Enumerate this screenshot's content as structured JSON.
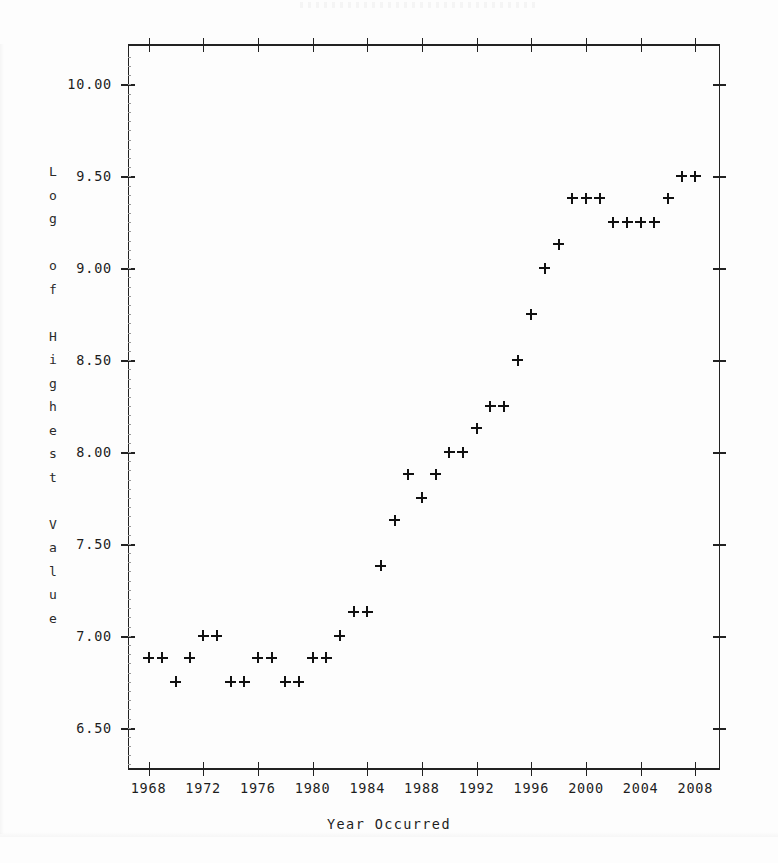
{
  "chart_data": {
    "type": "scatter",
    "title": "",
    "xlabel": "Year Occurred",
    "ylabel": "Log of Highest Value",
    "xlim": [
      1966.5,
      2009.8
    ],
    "ylim": [
      6.27,
      10.22
    ],
    "grid": false,
    "legend": null,
    "marker": "plus",
    "xticks": [
      1968,
      1972,
      1976,
      1980,
      1984,
      1988,
      1992,
      1996,
      2000,
      2004,
      2008
    ],
    "xtick_labels": [
      "1968",
      "1972",
      "1976",
      "1980",
      "1984",
      "1988",
      "1992",
      "1996",
      "2000",
      "2004",
      "2008"
    ],
    "yticks": [
      6.5,
      7.0,
      7.5,
      8.0,
      8.5,
      9.0,
      9.5,
      10.0
    ],
    "ytick_labels": [
      "6.50",
      "7.00",
      "7.50",
      "8.00",
      "8.50",
      "9.00",
      "9.50",
      "10.00"
    ],
    "x": [
      1968,
      1969,
      1970,
      1971,
      1972,
      1973,
      1974,
      1975,
      1976,
      1977,
      1978,
      1979,
      1980,
      1981,
      1982,
      1983,
      1984,
      1985,
      1986,
      1987,
      1988,
      1989,
      1990,
      1991,
      1992,
      1993,
      1994,
      1995,
      1996,
      1997,
      1998,
      1999,
      2000,
      2001,
      2002,
      2003,
      2004,
      2005,
      2006,
      2007,
      2008
    ],
    "y": [
      6.88,
      6.88,
      6.75,
      6.88,
      7.0,
      7.0,
      6.75,
      6.75,
      6.88,
      6.88,
      6.75,
      6.75,
      6.88,
      6.88,
      7.0,
      7.13,
      7.13,
      7.38,
      7.63,
      7.88,
      7.75,
      7.88,
      8.0,
      8.0,
      8.13,
      8.25,
      8.25,
      8.5,
      8.75,
      9.0,
      9.13,
      9.38,
      9.38,
      9.38,
      9.25,
      9.25,
      9.25,
      9.25,
      9.38,
      9.5,
      9.5
    ]
  },
  "axes": {
    "y_title_chars": [
      "L",
      "o",
      "g",
      "",
      "o",
      "f",
      "",
      "H",
      "i",
      "g",
      "h",
      "e",
      "s",
      "t",
      "",
      "V",
      "a",
      "l",
      "u",
      "e"
    ],
    "x_title": "Year Occurred"
  },
  "colors": {
    "ink": "#111111",
    "frame": "#222222",
    "background": "#fdfdfd"
  }
}
